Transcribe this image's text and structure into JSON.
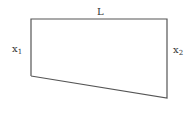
{
  "diagram": {
    "shape": "trapezoid",
    "stroke_color": "#555555",
    "labels": {
      "top": "L",
      "left": "x",
      "left_sub": "1",
      "right": "x",
      "right_sub": "2"
    }
  }
}
